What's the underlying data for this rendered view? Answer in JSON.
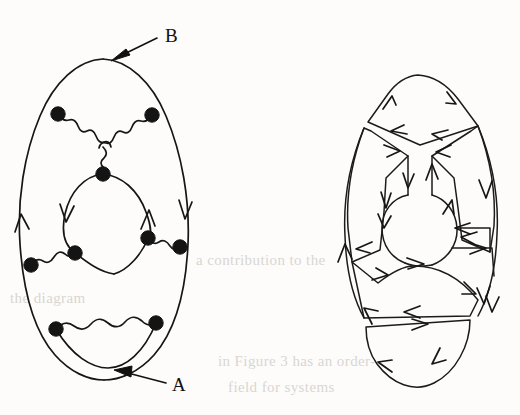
{
  "figure": {
    "kind": "hand-drawn-feynman-diagram-pair",
    "background_color": "#fdfcfa",
    "ink_color": "#161616",
    "annotations": [
      {
        "id": "label-b",
        "label": "B",
        "label_x": 168,
        "label_y": 40,
        "arrow_from_x": 157,
        "arrow_from_y": 38,
        "arrow_to_x": 113,
        "arrow_to_y": 59,
        "points_to": "outer-loop-top-left-diagram"
      },
      {
        "id": "label-a",
        "label": "A",
        "label_x": 175,
        "label_y": 390,
        "arrow_from_x": 166,
        "arrow_from_y": 383,
        "arrow_to_x": 116,
        "arrow_to_y": 371,
        "points_to": "outer-loop-bottom-left-diagram"
      }
    ],
    "left_diagram": {
      "name": "feynman-diagram-with-vertices",
      "vertex_count": 9,
      "vertex_radius": 7,
      "vertices": [
        {
          "id": "v-top-left",
          "x": 58,
          "y": 114
        },
        {
          "id": "v-top-right",
          "x": 152,
          "y": 115
        },
        {
          "id": "v-center",
          "x": 103,
          "y": 174
        },
        {
          "id": "v-mid-left-outer",
          "x": 31,
          "y": 265
        },
        {
          "id": "v-mid-left-inner",
          "x": 75,
          "y": 253
        },
        {
          "id": "v-mid-right-inner",
          "x": 148,
          "y": 238
        },
        {
          "id": "v-mid-right-outer",
          "x": 180,
          "y": 247
        },
        {
          "id": "v-bottom-left",
          "x": 56,
          "y": 329
        },
        {
          "id": "v-bottom-right",
          "x": 156,
          "y": 323
        }
      ],
      "wavy_edges": [
        {
          "id": "wavy-top-left-to-center",
          "from": "v-top-left",
          "to": "v-center"
        },
        {
          "id": "wavy-top-right-to-center",
          "from": "v-top-right",
          "to": "v-center"
        },
        {
          "id": "wavy-center-stem",
          "from": "v-center",
          "to": "junction"
        },
        {
          "id": "wavy-mid-left",
          "from": "v-mid-left-outer",
          "to": "v-mid-left-inner"
        },
        {
          "id": "wavy-mid-right",
          "from": "v-mid-right-inner",
          "to": "v-mid-right-outer"
        },
        {
          "id": "wavy-bottom",
          "from": "v-bottom-left",
          "to": "v-bottom-right"
        }
      ],
      "fermion_arrows": [
        {
          "id": "arrow-outer-left",
          "x": 24,
          "y": 220,
          "direction": "up"
        },
        {
          "id": "arrow-inner-left",
          "x": 68,
          "y": 218,
          "direction": "down"
        },
        {
          "id": "arrow-inner-right",
          "x": 152,
          "y": 212,
          "direction": "up"
        },
        {
          "id": "arrow-outer-right",
          "x": 184,
          "y": 214,
          "direction": "down"
        }
      ]
    },
    "right_diagram": {
      "name": "ribbon-fat-graph-double-line-diagram",
      "description": "double-line / ribbon 't Hooft representation of the left diagram with oriented index loops",
      "index_loop_count": 5,
      "arrow_count": 22,
      "center_x": 420,
      "center_y": 232
    }
  },
  "ghost_text": [
    {
      "id": "ghost-1",
      "text": "in Figure 3 has an order-",
      "x": 218,
      "y": 363
    },
    {
      "id": "ghost-2",
      "text": "field for systems",
      "x": 228,
      "y": 389
    },
    {
      "id": "ghost-3",
      "text": "a contribution to the",
      "x": 196,
      "y": 262
    },
    {
      "id": "ghost-4",
      "text": "the diagram",
      "x": 10,
      "y": 300
    }
  ]
}
